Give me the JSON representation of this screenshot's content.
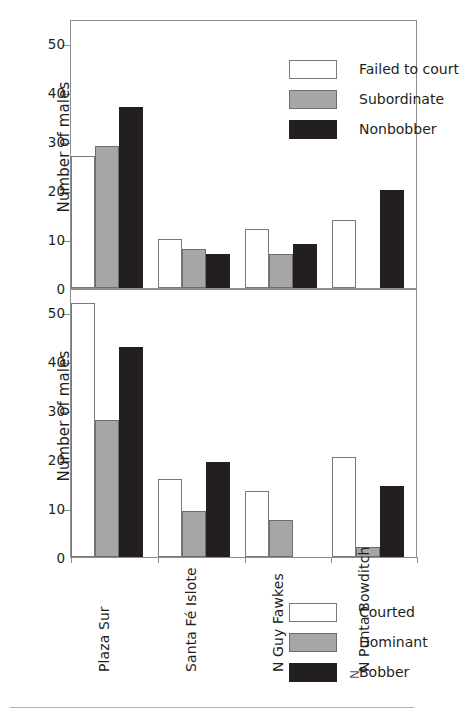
{
  "figure": {
    "top_caption": "",
    "stray_glyph": "N"
  },
  "chart_data": [
    {
      "type": "bar",
      "panel": "top",
      "title": "",
      "xlabel": "",
      "ylabel": "Number of males",
      "ylim": [
        0,
        55
      ],
      "yticks": [
        0,
        10,
        20,
        30,
        40,
        50
      ],
      "ytick_labels": [
        "0",
        "10",
        "20",
        "30",
        "40",
        "50"
      ],
      "grid": false,
      "legend_position": "top-right",
      "categories": [
        "Plaza Sur",
        "Santa Fé Islote",
        "N Guy Fawkes",
        "N Punta Bowditch"
      ],
      "series": [
        {
          "name": "Failed to court",
          "color": "#ffffff",
          "values": [
            27,
            10,
            12,
            14
          ]
        },
        {
          "name": "Subordinate",
          "color": "#a6a6a6",
          "values": [
            29,
            8,
            7,
            0
          ]
        },
        {
          "name": "Nonbobber",
          "color": "#231f20",
          "values": [
            37,
            7,
            9,
            20
          ]
        }
      ]
    },
    {
      "type": "bar",
      "panel": "bottom",
      "title": "",
      "xlabel": "",
      "ylabel": "Number of males",
      "ylim": [
        0,
        55
      ],
      "yticks": [
        0,
        10,
        20,
        30,
        40,
        50
      ],
      "ytick_labels": [
        "0",
        "10",
        "20",
        "30",
        "40",
        "50"
      ],
      "grid": false,
      "legend_position": "top-right",
      "categories": [
        "Plaza Sur",
        "Santa Fé Islote",
        "N Guy Fawkes",
        "N Punta Bowditch"
      ],
      "series": [
        {
          "name": "Courted",
          "color": "#ffffff",
          "values": [
            52,
            16,
            13.5,
            20.5
          ]
        },
        {
          "name": "Dominant",
          "color": "#a6a6a6",
          "values": [
            28,
            9.5,
            7.5,
            2
          ]
        },
        {
          "name": "Bobber",
          "color": "#231f20",
          "values": [
            43,
            19.5,
            0,
            14.5
          ]
        }
      ]
    }
  ]
}
